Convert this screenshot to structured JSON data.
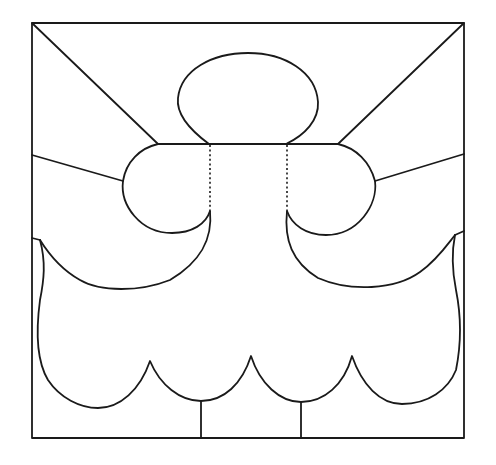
{
  "diagram": {
    "title": "Line drawing of a figure inside a square frame",
    "stroke_color": "#1a1a1a",
    "background_color": "#ffffff",
    "frame": {
      "x": 32,
      "y": 23,
      "width": 432,
      "height": 415
    },
    "parts": [
      {
        "id": "frame",
        "label": "square frame"
      },
      {
        "id": "head",
        "label": "oval head"
      },
      {
        "id": "left-shoulder",
        "label": "left shoulder lobe"
      },
      {
        "id": "right-shoulder",
        "label": "right shoulder lobe"
      },
      {
        "id": "neck-dotted-lines",
        "label": "dotted neck lines"
      },
      {
        "id": "diagonal-rays",
        "label": "corner rays"
      },
      {
        "id": "body-skirt",
        "label": "scalloped body"
      },
      {
        "id": "feet-lines",
        "label": "vertical lines to base"
      }
    ]
  }
}
